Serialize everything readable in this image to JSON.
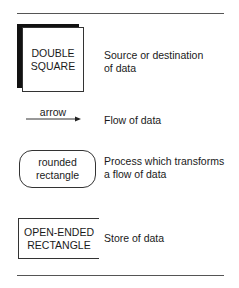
{
  "legend": {
    "items": [
      {
        "symbol": "double-square",
        "label_lines": [
          "DOUBLE",
          "SQUARE"
        ],
        "description_lines": [
          "Source or destination",
          "of data"
        ]
      },
      {
        "symbol": "arrow",
        "label_lines": [
          "arrow"
        ],
        "description_lines": [
          "Flow of data"
        ]
      },
      {
        "symbol": "rounded-rectangle",
        "label_lines": [
          "rounded",
          "rectangle"
        ],
        "description_lines": [
          "Process which transforms",
          "a flow of data"
        ]
      },
      {
        "symbol": "open-ended-rectangle",
        "label_lines": [
          "OPEN-ENDED",
          "RECTANGLE"
        ],
        "description_lines": [
          "Store of data"
        ]
      }
    ]
  },
  "colors": {
    "line": "#333333",
    "shadow": "#111111",
    "text": "#1a1a1a"
  }
}
